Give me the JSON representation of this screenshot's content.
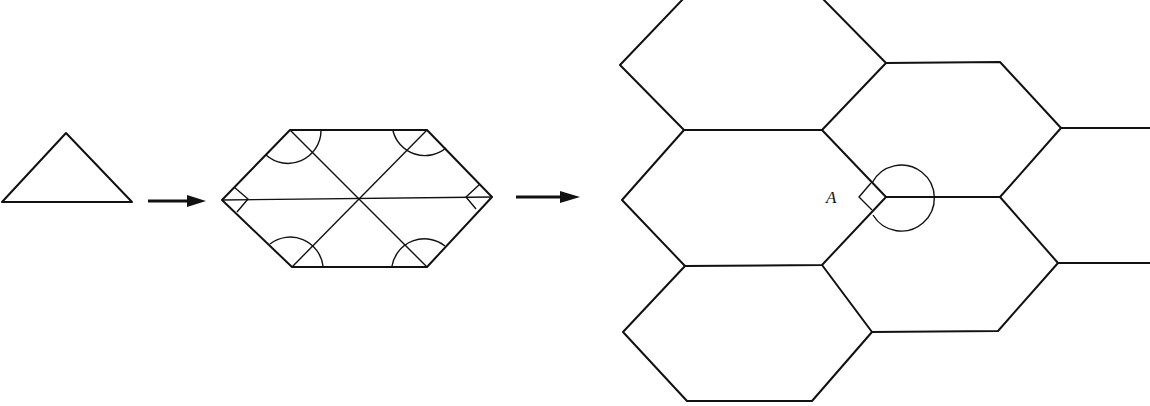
{
  "figure": {
    "stroke_color": "#111111",
    "background": "#ffffff",
    "steps": [
      {
        "name": "triangle",
        "shape": "triangle"
      },
      {
        "name": "arrow-1",
        "shape": "arrow-right"
      },
      {
        "name": "hexagon-of-triangles",
        "shape": "hexagon",
        "angle_marks": 6
      },
      {
        "name": "arrow-2",
        "shape": "arrow-right"
      },
      {
        "name": "hexagon-tiling",
        "shape": "tessellation",
        "hexagon_count": 6
      }
    ],
    "vertex_label": "A"
  }
}
